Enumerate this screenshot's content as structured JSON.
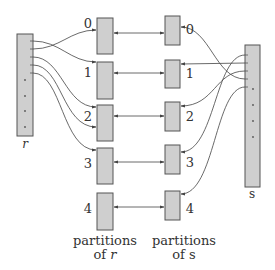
{
  "diagram": {
    "relations": {
      "r": {
        "label": "r",
        "italic": true
      },
      "s": {
        "label": "s",
        "italic": false
      }
    },
    "partitions_r": {
      "caption_line1": "partitions",
      "caption_line2_prefix": "of ",
      "caption_line2_var": "r",
      "labels": [
        "0",
        "1",
        "2",
        "3",
        "4"
      ]
    },
    "partitions_s": {
      "caption_line1": "partitions",
      "caption_line2_prefix": "of ",
      "caption_line2_var": "s",
      "labels": [
        "0",
        "1",
        "2",
        "3",
        "4"
      ]
    },
    "edges_r_to_partitions": [
      {
        "from_tuple": 0,
        "to_partition": 1
      },
      {
        "from_tuple": 1,
        "to_partition": 0
      },
      {
        "from_tuple": 2,
        "to_partition": 2
      },
      {
        "from_tuple": 3,
        "to_partition": 2
      },
      {
        "from_tuple": 4,
        "to_partition": 3
      }
    ],
    "edges_s_to_partitions": [
      {
        "from_tuple": 0,
        "to_partition": 3
      },
      {
        "from_tuple": 1,
        "to_partition": 1
      },
      {
        "from_tuple": 2,
        "to_partition": 2
      },
      {
        "from_tuple": 3,
        "to_partition": 0
      },
      {
        "from_tuple": 4,
        "to_partition": 4
      }
    ],
    "partition_pairs": [
      "0",
      "1",
      "2",
      "3",
      "4"
    ],
    "colors": {
      "box_fill": "#cfcfcf",
      "box_stroke": "#555555",
      "line": "#444444",
      "text": "#333333"
    }
  }
}
